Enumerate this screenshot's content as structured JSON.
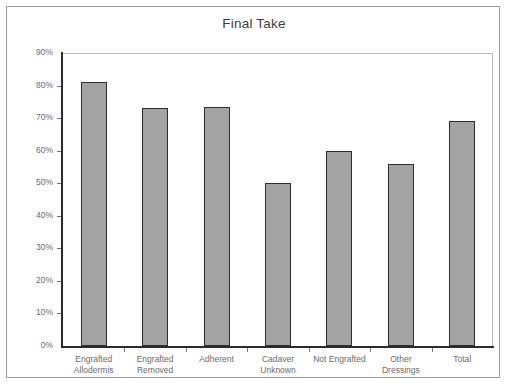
{
  "chart_data": {
    "type": "bar",
    "title": "Final Take",
    "xlabel": "",
    "ylabel": "",
    "ylim": [
      0,
      90
    ],
    "ytick_labels": [
      "90%",
      "80%",
      "70%",
      "60%",
      "50%",
      "40%",
      "30%",
      "20%",
      "10%",
      "0%"
    ],
    "ytick_values": [
      90,
      80,
      70,
      60,
      50,
      40,
      30,
      20,
      10,
      0
    ],
    "grid": false,
    "legend": null,
    "categories": [
      "Engrafted Allodermis",
      "Engrafted Removed",
      "Adherent",
      "Cadaver Unknown",
      "Not Engrafted",
      "Other Dressings",
      "Total"
    ],
    "category_lines": [
      [
        "Engrafted",
        "Allodermis"
      ],
      [
        "Engrafted",
        "Removed"
      ],
      [
        "Adherent",
        ""
      ],
      [
        "Cadaver",
        "Unknown"
      ],
      [
        "Not Engrafted",
        ""
      ],
      [
        "Other",
        "Dressings"
      ],
      [
        "Total",
        ""
      ]
    ],
    "values": [
      81,
      73,
      73.5,
      50,
      60,
      56,
      69
    ],
    "value_labels": [
      "81%",
      "73%",
      "73.5%",
      "50%",
      "60%",
      "56%",
      "69%"
    ],
    "colors": {
      "bar_fill": "#a3a3a3",
      "bar_edge": "#2e2e2e",
      "axis": "#2b2b2b",
      "plot_border": "#b9b9b9",
      "frame_border": "#9a9a9a",
      "tick_text": "#6b6b6b",
      "title_text": "#3d3d3d",
      "background": "#ffffff"
    }
  }
}
